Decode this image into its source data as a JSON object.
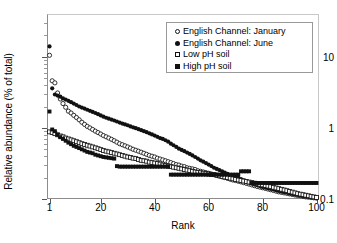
{
  "chart_data": {
    "type": "scatter",
    "title": "",
    "xlabel": "Rank",
    "ylabel": "Relative abundance (% of total)",
    "yscale": "log",
    "xlim": [
      1,
      100
    ],
    "ylim": [
      0.1,
      40
    ],
    "grid": false,
    "legend_position": "top-right",
    "xticks": [
      "1",
      "20",
      "40",
      "60",
      "80",
      "100"
    ],
    "xtick_values": [
      1,
      20,
      40,
      60,
      80,
      100
    ],
    "yticks": [
      "10",
      "1",
      "0.1"
    ],
    "ytick_values": [
      10,
      1,
      0.1
    ],
    "x": [
      1,
      2,
      3,
      4,
      5,
      6,
      7,
      8,
      9,
      10,
      11,
      12,
      13,
      14,
      15,
      16,
      17,
      18,
      19,
      20,
      21,
      22,
      23,
      24,
      25,
      26,
      27,
      28,
      29,
      30,
      31,
      32,
      33,
      34,
      35,
      36,
      37,
      38,
      39,
      40,
      41,
      42,
      43,
      44,
      45,
      46,
      47,
      48,
      49,
      50,
      51,
      52,
      53,
      54,
      55,
      56,
      57,
      58,
      59,
      60,
      61,
      62,
      63,
      64,
      65,
      66,
      67,
      68,
      69,
      70,
      71,
      72,
      73,
      74,
      75,
      76,
      77,
      78,
      79,
      80,
      81,
      82,
      83,
      84,
      85,
      86,
      87,
      88,
      89,
      90,
      91,
      92,
      93,
      94,
      95,
      96,
      97,
      98,
      99,
      100
    ],
    "series": [
      {
        "name": "English Channel: January",
        "marker": "circle-open",
        "color": "#111111",
        "values": [
          10.5,
          4.6,
          4.3,
          3.1,
          2.55,
          2.2,
          1.95,
          1.72,
          1.62,
          1.5,
          1.4,
          1.3,
          1.2,
          1.12,
          1.05,
          1.0,
          0.95,
          0.9,
          0.86,
          0.82,
          0.78,
          0.75,
          0.72,
          0.69,
          0.66,
          0.63,
          0.6,
          0.58,
          0.56,
          0.54,
          0.52,
          0.5,
          0.485,
          0.47,
          0.455,
          0.44,
          0.425,
          0.41,
          0.4,
          0.39,
          0.375,
          0.365,
          0.355,
          0.345,
          0.335,
          0.325,
          0.315,
          0.305,
          0.3,
          0.29,
          0.285,
          0.275,
          0.27,
          0.265,
          0.26,
          0.25,
          0.245,
          0.24,
          0.235,
          0.23,
          0.225,
          0.22,
          0.215,
          0.21,
          0.205,
          0.2,
          0.195,
          0.19,
          0.185,
          0.182,
          0.178,
          0.174,
          0.17,
          0.166,
          0.162,
          0.158,
          0.154,
          0.15,
          0.147,
          0.144,
          0.141,
          0.138,
          0.135,
          0.132,
          0.129,
          0.126,
          0.124,
          0.122,
          0.12,
          0.118,
          0.116,
          0.114,
          0.112,
          0.111,
          0.109,
          0.107,
          0.106,
          0.105,
          0.104,
          0.103
        ]
      },
      {
        "name": "English Channel: June",
        "marker": "circle-fill",
        "color": "#111111",
        "values": [
          14.0,
          3.6,
          2.95,
          2.85,
          2.75,
          2.6,
          2.5,
          2.4,
          2.3,
          2.2,
          2.1,
          2.0,
          1.93,
          1.87,
          1.8,
          1.74,
          1.68,
          1.62,
          1.56,
          1.5,
          1.44,
          1.39,
          1.35,
          1.31,
          1.27,
          1.23,
          1.19,
          1.15,
          1.12,
          1.09,
          1.05,
          1.02,
          0.99,
          0.96,
          0.93,
          0.9,
          0.87,
          0.84,
          0.81,
          0.78,
          0.75,
          0.72,
          0.7,
          0.67,
          0.64,
          0.6,
          0.57,
          0.54,
          0.51,
          0.49,
          0.47,
          0.45,
          0.43,
          0.41,
          0.39,
          0.37,
          0.35,
          0.335,
          0.32,
          0.305,
          0.29,
          0.275,
          0.265,
          0.255,
          0.245,
          0.235,
          0.225,
          0.215,
          0.21,
          0.205,
          0.198,
          0.19,
          0.183,
          0.176,
          0.17,
          0.165,
          0.16,
          0.156,
          0.152,
          0.148,
          0.145,
          0.142,
          0.139,
          0.136,
          0.133,
          0.13,
          0.127,
          0.125,
          0.123,
          0.12,
          0.118,
          0.116,
          0.114,
          0.112,
          0.11,
          0.108,
          0.107,
          0.106,
          0.105,
          0.104
        ]
      },
      {
        "name": "Low pH soil",
        "marker": "square-open",
        "color": "#111111",
        "values": [
          0.88,
          0.86,
          0.83,
          0.8,
          0.77,
          0.75,
          0.72,
          0.7,
          0.68,
          0.66,
          0.64,
          0.62,
          0.6,
          0.585,
          0.57,
          0.555,
          0.54,
          0.525,
          0.51,
          0.495,
          0.48,
          0.47,
          0.46,
          0.45,
          0.44,
          0.43,
          0.42,
          0.41,
          0.4,
          0.39,
          0.385,
          0.375,
          0.37,
          0.36,
          0.35,
          0.345,
          0.34,
          0.33,
          0.325,
          0.32,
          0.315,
          0.31,
          0.3,
          0.295,
          0.29,
          0.285,
          0.28,
          0.275,
          0.27,
          0.265,
          0.26,
          0.255,
          0.25,
          0.245,
          0.24,
          0.237,
          0.234,
          0.231,
          0.228,
          0.225,
          0.222,
          0.22,
          0.216,
          0.212,
          0.208,
          0.204,
          0.2,
          0.196,
          0.192,
          0.188,
          0.185,
          0.182,
          0.179,
          0.176,
          0.173,
          0.17,
          0.167,
          0.164,
          0.161,
          0.158,
          0.155,
          0.152,
          0.149,
          0.146,
          0.143,
          0.14,
          0.137,
          0.134,
          0.131,
          0.128,
          0.125,
          0.122,
          0.119,
          0.117,
          0.115,
          0.113,
          0.111,
          0.109,
          0.107,
          0.105
        ]
      },
      {
        "name": "High pH soil",
        "marker": "square-fill",
        "color": "#111111",
        "values": [
          1.7,
          0.95,
          0.9,
          0.8,
          0.74,
          0.7,
          0.66,
          0.62,
          0.59,
          0.56,
          0.54,
          0.52,
          0.5,
          0.48,
          0.46,
          0.45,
          0.44,
          0.42,
          0.41,
          0.4,
          0.39,
          0.385,
          0.38,
          0.375,
          0.37,
          0.29,
          0.285,
          0.285,
          0.285,
          0.285,
          0.285,
          0.285,
          0.285,
          0.285,
          0.285,
          0.285,
          0.285,
          0.285,
          0.285,
          0.285,
          0.285,
          0.285,
          0.285,
          0.285,
          0.285,
          0.22,
          0.22,
          0.22,
          0.22,
          0.22,
          0.22,
          0.22,
          0.22,
          0.22,
          0.22,
          0.22,
          0.22,
          0.22,
          0.22,
          0.22,
          0.22,
          0.22,
          0.22,
          0.22,
          0.22,
          0.22,
          0.22,
          0.22,
          0.22,
          0.22,
          0.22,
          0.245,
          0.245,
          0.245,
          0.245,
          0.168,
          0.168,
          0.168,
          0.168,
          0.168,
          0.168,
          0.168,
          0.168,
          0.168,
          0.168,
          0.168,
          0.168,
          0.168,
          0.168,
          0.168,
          0.168,
          0.168,
          0.168,
          0.168,
          0.168,
          0.168,
          0.168,
          0.168,
          0.168,
          0.168
        ]
      }
    ]
  }
}
